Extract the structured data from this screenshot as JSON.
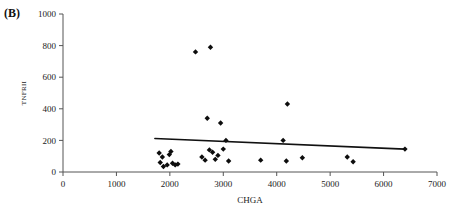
{
  "figure": {
    "panel_label": "(B)",
    "background_color": "#ffffff",
    "marker_color": "#0d0d0d",
    "axis_color": "#555555",
    "trendline_color": "#111111"
  },
  "chart_data": {
    "type": "scatter",
    "title": "",
    "subtitle": "",
    "panel": "(B)",
    "xlabel": "CHGA",
    "ylabel": "TNFRII",
    "xlim": [
      0,
      7000
    ],
    "ylim": [
      0,
      1000
    ],
    "xticks": [
      0,
      1000,
      2000,
      3000,
      4000,
      5000,
      6000,
      7000
    ],
    "yticks": [
      0,
      200,
      400,
      600,
      800,
      1000
    ],
    "xtick_labels": [
      "0",
      "1000",
      "2000",
      "3000",
      "4000",
      "5000",
      "6000",
      "7000"
    ],
    "ytick_labels": [
      "0",
      "200",
      "400",
      "600",
      "800",
      "1000"
    ],
    "grid": false,
    "legend": null,
    "marker_style": "diamond",
    "points": [
      {
        "x": 1800,
        "y": 120
      },
      {
        "x": 1820,
        "y": 60
      },
      {
        "x": 1860,
        "y": 95
      },
      {
        "x": 1880,
        "y": 35
      },
      {
        "x": 1950,
        "y": 45
      },
      {
        "x": 1990,
        "y": 110
      },
      {
        "x": 2020,
        "y": 130
      },
      {
        "x": 2050,
        "y": 55
      },
      {
        "x": 2100,
        "y": 45
      },
      {
        "x": 2150,
        "y": 50
      },
      {
        "x": 2480,
        "y": 760
      },
      {
        "x": 2600,
        "y": 95
      },
      {
        "x": 2660,
        "y": 75
      },
      {
        "x": 2700,
        "y": 340
      },
      {
        "x": 2740,
        "y": 140
      },
      {
        "x": 2760,
        "y": 790
      },
      {
        "x": 2800,
        "y": 125
      },
      {
        "x": 2850,
        "y": 80
      },
      {
        "x": 2900,
        "y": 105
      },
      {
        "x": 2950,
        "y": 310
      },
      {
        "x": 3000,
        "y": 145
      },
      {
        "x": 3050,
        "y": 200
      },
      {
        "x": 3100,
        "y": 70
      },
      {
        "x": 3700,
        "y": 75
      },
      {
        "x": 4120,
        "y": 200
      },
      {
        "x": 4200,
        "y": 430
      },
      {
        "x": 4180,
        "y": 70
      },
      {
        "x": 4480,
        "y": 90
      },
      {
        "x": 5320,
        "y": 95
      },
      {
        "x": 5430,
        "y": 65
      },
      {
        "x": 6400,
        "y": 145
      }
    ],
    "trendline": {
      "type": "linear-fit",
      "x_start": 1720,
      "y_start": 212,
      "x_end": 6400,
      "y_end": 145
    }
  }
}
